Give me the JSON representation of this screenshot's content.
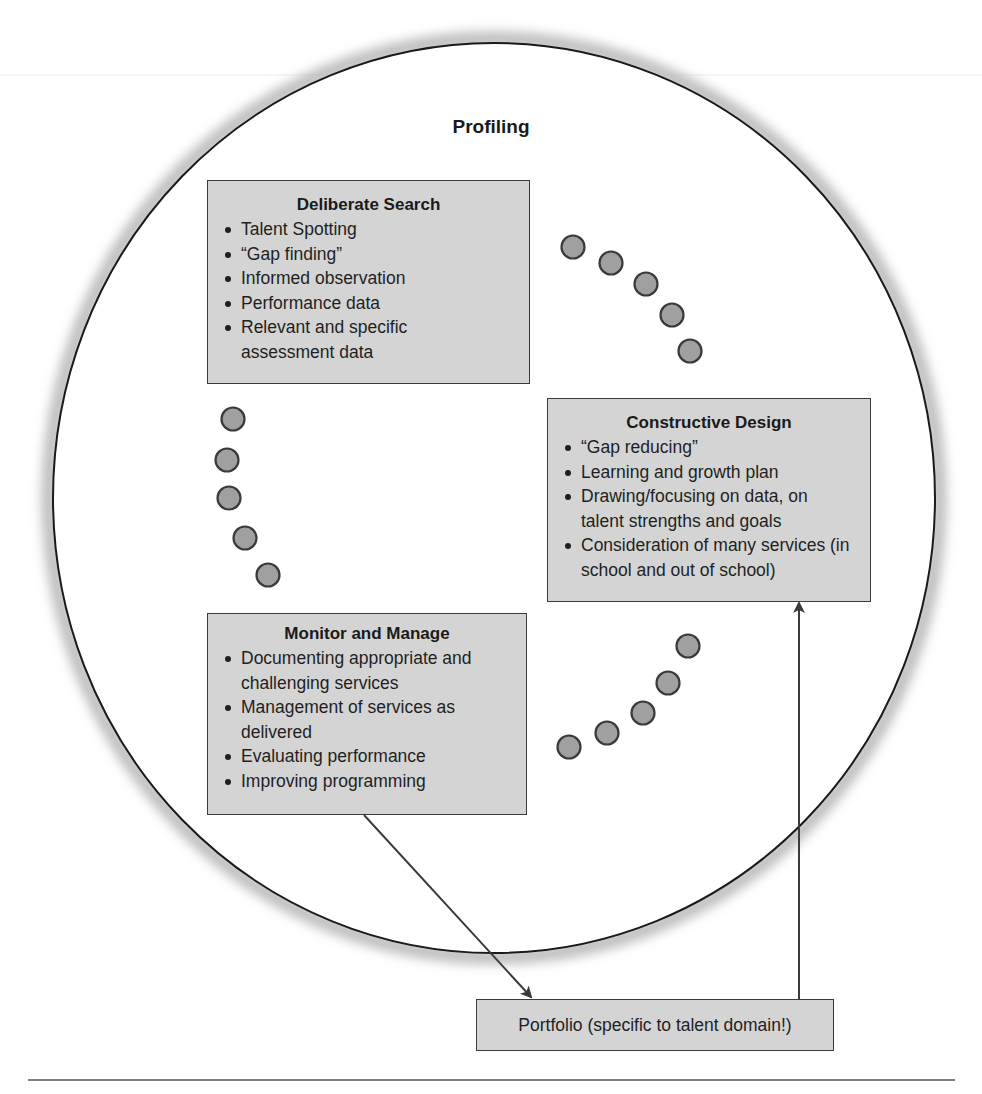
{
  "diagram": {
    "title": "Profiling",
    "boxes": {
      "deliberate_search": {
        "heading": "Deliberate Search",
        "items": [
          "Talent Spotting",
          "“Gap finding”",
          "Informed observation",
          "Performance data",
          "Relevant and specific assessment data"
        ]
      },
      "constructive_design": {
        "heading": "Constructive Design",
        "items": [
          "“Gap reducing”",
          "Learning and growth plan",
          "Drawing/focusing on data, on talent strengths and goals",
          "Consideration of many services (in school and out of school)"
        ]
      },
      "monitor_and_manage": {
        "heading": "Monitor and Manage",
        "items": [
          "Documenting appropriate and challenging services",
          "Management of services as delivered",
          "Evaluating performance",
          "Improving programming"
        ]
      },
      "portfolio": {
        "label": "Portfolio (specific to talent domain!)"
      }
    },
    "connectors": [
      {
        "from": "deliberate_search",
        "to": "constructive_design",
        "style": "dotted-circles",
        "count": 5
      },
      {
        "from": "constructive_design",
        "to": "monitor_and_manage",
        "style": "dotted-circles",
        "count": 5
      },
      {
        "from": "monitor_and_manage",
        "to": "deliberate_search",
        "style": "dotted-circles",
        "count": 5
      },
      {
        "from": "monitor_and_manage",
        "to": "portfolio",
        "style": "arrow"
      },
      {
        "from": "portfolio",
        "to": "constructive_design",
        "style": "arrow"
      }
    ],
    "colors": {
      "box_fill": "#d4d4d4",
      "box_border": "#3a3a3a",
      "dot_fill": "#a0a0a0",
      "line": "#3a3a3a"
    }
  }
}
